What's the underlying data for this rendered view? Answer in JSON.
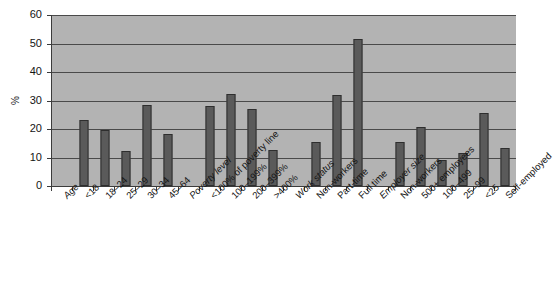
{
  "chart_data": {
    "type": "bar",
    "title": "",
    "subtitle": "",
    "xlabel": "",
    "ylabel": "%",
    "ylim": [
      0,
      60
    ],
    "ytick_values": [
      0,
      10,
      20,
      30,
      40,
      50,
      60
    ],
    "ytick_labels": [
      "0",
      "10",
      "20",
      "30",
      "40",
      "50",
      "60"
    ],
    "grid": true,
    "legend": "none",
    "orientation": "vertical",
    "bar_color": "#5a5a5a",
    "plot_background": "#b3b3b3",
    "axis_color": "#3c3c3c",
    "categories": [
      "Age",
      "<18",
      "18–24",
      "25–29",
      "30–34",
      "45–64",
      "Poverty level",
      "<100% of poverty line",
      "100–199%",
      "200–399%",
      ">400%",
      "Work status",
      "Non-workers",
      "Part-time",
      "Full time",
      "Employer size",
      "Non-workers",
      "500+ employees",
      "100–499",
      "25–99",
      "<25",
      "Self-employed"
    ],
    "category_is_header": [
      true,
      false,
      false,
      false,
      false,
      false,
      true,
      false,
      false,
      false,
      false,
      true,
      false,
      false,
      false,
      true,
      false,
      false,
      false,
      false,
      false,
      false
    ],
    "values": [
      null,
      23.3,
      19.6,
      12.3,
      28.4,
      18.4,
      null,
      28.2,
      32.2,
      27.0,
      12.8,
      null,
      15.6,
      32.0,
      51.6,
      null,
      15.5,
      20.8,
      9.0,
      11.5,
      25.6,
      13.3
    ]
  }
}
